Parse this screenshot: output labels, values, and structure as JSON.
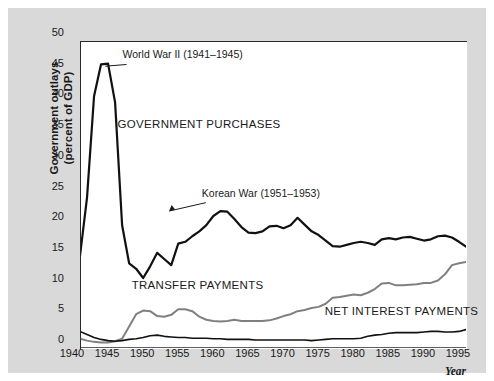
{
  "figure": {
    "y_axis_title_line1": "Government outlays",
    "y_axis_title_line2": "(percent of GDP)",
    "x_axis_title": "Year"
  },
  "chart_data": {
    "type": "line",
    "title": "",
    "xlabel": "Year",
    "ylabel": "Government outlays (percent of GDP)",
    "xlim": [
      1940,
      1995
    ],
    "ylim": [
      0,
      50
    ],
    "grid": false,
    "legend_position": "inline-labels",
    "x_ticks": [
      1940,
      1945,
      1950,
      1955,
      1960,
      1965,
      1970,
      1975,
      1980,
      1985,
      1990,
      1995
    ],
    "y_ticks": [
      0,
      5,
      10,
      15,
      20,
      25,
      30,
      35,
      40,
      45,
      50
    ],
    "x": [
      1940,
      1941,
      1942,
      1943,
      1944,
      1945,
      1946,
      1947,
      1948,
      1949,
      1950,
      1951,
      1952,
      1953,
      1954,
      1955,
      1956,
      1957,
      1958,
      1959,
      1960,
      1961,
      1962,
      1963,
      1964,
      1965,
      1966,
      1967,
      1968,
      1969,
      1970,
      1971,
      1972,
      1973,
      1974,
      1975,
      1976,
      1977,
      1978,
      1979,
      1980,
      1981,
      1982,
      1983,
      1984,
      1985,
      1986,
      1987,
      1988,
      1989,
      1990,
      1991,
      1992,
      1993,
      1994,
      1995
    ],
    "series": [
      {
        "name": "GOVERNMENT PURCHASES",
        "color": "#111111",
        "width": 2.2,
        "values": [
          15.0,
          24.5,
          41.0,
          46.2,
          46.3,
          40.0,
          20.0,
          13.8,
          12.9,
          11.4,
          13.3,
          15.5,
          14.5,
          13.5,
          17.0,
          17.3,
          18.2,
          19.0,
          20.0,
          21.5,
          22.3,
          22.2,
          21.0,
          19.7,
          18.8,
          18.7,
          19.0,
          19.8,
          19.9,
          19.5,
          20.0,
          21.2,
          20.1,
          19.0,
          18.4,
          17.5,
          16.6,
          16.5,
          16.8,
          17.1,
          17.3,
          17.1,
          16.8,
          17.7,
          17.9,
          17.7,
          18.0,
          18.1,
          17.8,
          17.5,
          17.7,
          18.2,
          18.3,
          18.0,
          17.3,
          16.5
        ]
      },
      {
        "name": "TRANSFER PAYMENTS",
        "color": "#808080",
        "width": 2.0,
        "values": [
          1.5,
          1.2,
          1.0,
          0.9,
          0.9,
          1.1,
          1.5,
          3.5,
          5.5,
          6.1,
          6.0,
          5.2,
          5.1,
          5.4,
          6.3,
          6.3,
          6.0,
          5.1,
          4.6,
          4.4,
          4.3,
          4.4,
          4.6,
          4.4,
          4.4,
          4.4,
          4.4,
          4.5,
          4.8,
          5.2,
          5.5,
          6.0,
          6.2,
          6.5,
          6.7,
          7.2,
          8.2,
          8.3,
          8.5,
          8.7,
          8.6,
          9.0,
          9.6,
          10.5,
          10.6,
          10.2,
          10.2,
          10.3,
          10.4,
          10.6,
          10.6,
          11.0,
          12.0,
          13.5,
          13.8,
          14.0
        ]
      },
      {
        "name": "NET INTEREST PAYMENTS",
        "color": "#111111",
        "width": 1.6,
        "values": [
          2.7,
          2.2,
          1.7,
          1.4,
          1.2,
          1.1,
          1.2,
          1.4,
          1.5,
          1.7,
          2.0,
          2.1,
          1.9,
          1.8,
          1.7,
          1.7,
          1.6,
          1.6,
          1.6,
          1.5,
          1.5,
          1.4,
          1.4,
          1.4,
          1.4,
          1.3,
          1.3,
          1.3,
          1.3,
          1.3,
          1.3,
          1.3,
          1.3,
          1.2,
          1.3,
          1.4,
          1.5,
          1.5,
          1.5,
          1.5,
          1.6,
          1.9,
          2.1,
          2.2,
          2.4,
          2.5,
          2.5,
          2.5,
          2.5,
          2.6,
          2.7,
          2.7,
          2.6,
          2.6,
          2.7,
          3.0
        ]
      }
    ],
    "annotations": [
      {
        "text": "World War II (1941–1945)",
        "x": 1947.2,
        "y": 46.5,
        "leader_from_x": 1943.6,
        "leader_from_y": 45.9
      },
      {
        "text": "Korean War (1951–1953)",
        "x": 1958.5,
        "y": 24.0,
        "leader_from_x": 1952.7,
        "leader_from_y": 22.3
      }
    ],
    "inline_labels": [
      {
        "text": "GOVERNMENT PURCHASES",
        "x": 1946.5,
        "y": 35.0
      },
      {
        "text": "TRANSFER PAYMENTS",
        "x": 1948.5,
        "y": 8.8
      },
      {
        "text": "NET INTEREST PAYMENTS",
        "x": 1976.0,
        "y": 4.6
      }
    ]
  }
}
